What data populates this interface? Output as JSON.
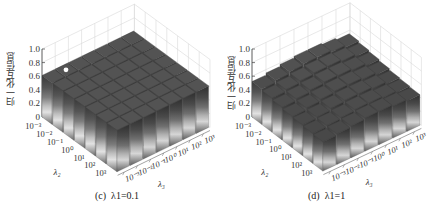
{
  "chart_data": [
    {
      "type": "bar3d",
      "title": "(c) λ1=0.1",
      "caption_label": "(c)",
      "caption_param": "λ1=0.1",
      "zlabel": "归一化互信息",
      "xlabel": "λ2",
      "ylabel": "λ3",
      "zlim": [
        0,
        1.0
      ],
      "zticks": [
        "0",
        "0.2",
        "0.4",
        "0.6",
        "0.8",
        "1.0"
      ],
      "x_ticks": [
        "10^-3",
        "10^-2",
        "10^-1",
        "10^0",
        "10^1",
        "10^2",
        "10^3"
      ],
      "y_ticks": [
        "10^-3",
        "10^-2",
        "10^-1",
        "10^0",
        "10^1",
        "10^2",
        "10^3"
      ],
      "grid": true,
      "values": [
        [
          0.61,
          0.61,
          0.61,
          0.61,
          0.61,
          0.61,
          0.61
        ],
        [
          0.61,
          0.61,
          0.61,
          0.61,
          0.61,
          0.61,
          0.61
        ],
        [
          0.61,
          0.61,
          0.61,
          0.61,
          0.61,
          0.61,
          0.61
        ],
        [
          0.61,
          0.61,
          0.61,
          0.61,
          0.61,
          0.61,
          0.61
        ],
        [
          0.61,
          0.61,
          0.61,
          0.61,
          0.61,
          0.61,
          0.61
        ],
        [
          0.61,
          0.61,
          0.61,
          0.61,
          0.61,
          0.61,
          0.61
        ],
        [
          0.61,
          0.61,
          0.61,
          0.61,
          0.61,
          0.61,
          0.61
        ]
      ],
      "marker": {
        "x_index": 0,
        "y_index": 1,
        "note": "white dot on top surface"
      }
    },
    {
      "type": "bar3d",
      "title": "(d) λ1=1",
      "caption_label": "(d)",
      "caption_param": "λ1=1",
      "zlabel": "归一化互信息",
      "xlabel": "λ2",
      "ylabel": "λ3",
      "zlim": [
        0,
        1.0
      ],
      "zticks": [
        "0",
        "0.2",
        "0.4",
        "0.6",
        "0.8",
        "1.0"
      ],
      "x_ticks": [
        "10^-3",
        "10^-2",
        "10^-1",
        "10^0",
        "10^1",
        "10^2",
        "10^3"
      ],
      "y_ticks": [
        "10^-3",
        "10^-2",
        "10^-1",
        "10^0",
        "10^1",
        "10^2",
        "10^3"
      ],
      "grid": true,
      "values": [
        [
          0.52,
          0.55,
          0.58,
          0.6,
          0.6,
          0.58,
          0.55
        ],
        [
          0.5,
          0.53,
          0.56,
          0.58,
          0.58,
          0.56,
          0.53
        ],
        [
          0.48,
          0.51,
          0.54,
          0.56,
          0.56,
          0.54,
          0.51
        ],
        [
          0.46,
          0.49,
          0.52,
          0.54,
          0.54,
          0.52,
          0.49
        ],
        [
          0.45,
          0.47,
          0.5,
          0.52,
          0.52,
          0.5,
          0.47
        ],
        [
          0.44,
          0.46,
          0.48,
          0.5,
          0.5,
          0.48,
          0.46
        ],
        [
          0.43,
          0.45,
          0.47,
          0.49,
          0.49,
          0.47,
          0.45
        ]
      ]
    }
  ],
  "panels": {
    "c": {
      "caption_label": "(c)",
      "caption_param": "λ1=0.1"
    },
    "d": {
      "caption_label": "(d)",
      "caption_param": "λ1=1"
    }
  },
  "axis_text": {
    "zlabel": "归一化互信息",
    "x_name": "λ₂",
    "y_name": "λ₃",
    "zticks": [
      "0",
      "0.2",
      "0.4",
      "0.6",
      "0.8",
      "1.0"
    ],
    "ticks": [
      "10⁻³",
      "10⁻²",
      "10⁻¹",
      "10⁰",
      "10¹",
      "10²",
      "10³"
    ]
  }
}
